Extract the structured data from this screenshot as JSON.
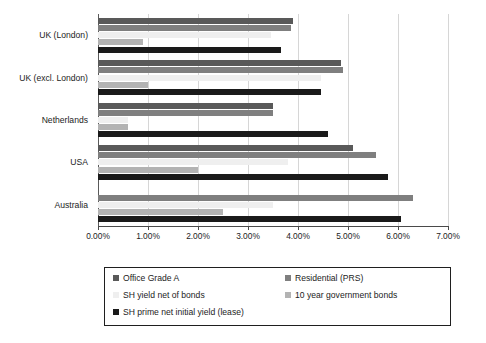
{
  "chart_data": {
    "type": "bar",
    "orientation": "horizontal",
    "title": "",
    "xlabel": "",
    "ylabel": "",
    "xlim": [
      0,
      7
    ],
    "xtick_labels": [
      "0.00%",
      "1.00%",
      "2.00%",
      "3.00%",
      "4.00%",
      "5.00%",
      "6.00%",
      "7.00%"
    ],
    "xticks": [
      0,
      1,
      2,
      3,
      4,
      5,
      6,
      7
    ],
    "grid": true,
    "legend_position": "bottom",
    "categories": [
      "UK (London)",
      "UK (excl. London)",
      "Netherlands",
      "USA",
      "Australia"
    ],
    "series": [
      {
        "name": "Office Grade A",
        "color": "#595959",
        "values": [
          3.9,
          4.85,
          3.5,
          5.1,
          0.0
        ]
      },
      {
        "name": "Residential (PRS)",
        "color": "#7f7f7f",
        "values": [
          3.85,
          4.9,
          3.5,
          5.55,
          6.3
        ]
      },
      {
        "name": "SH yield net of bonds",
        "color": "#efefef",
        "values": [
          3.45,
          4.45,
          0.6,
          3.8,
          3.5
        ]
      },
      {
        "name": "10 year government bonds",
        "color": "#b3b3b3",
        "values": [
          0.9,
          1.0,
          0.6,
          2.0,
          2.5
        ]
      },
      {
        "name": "SH prime net initial yield (lease)",
        "color": "#1a1a1a",
        "values": [
          3.65,
          4.45,
          4.6,
          5.8,
          6.05
        ]
      }
    ]
  },
  "legend": {
    "items": [
      {
        "label": "Office Grade A",
        "color": "#595959"
      },
      {
        "label": "Residential (PRS)",
        "color": "#7f7f7f"
      },
      {
        "label": "SH yield net of bonds",
        "color": "#efefef"
      },
      {
        "label": "10 year government bonds",
        "color": "#b3b3b3"
      },
      {
        "label": "SH prime net initial yield (lease)",
        "color": "#1a1a1a"
      }
    ]
  },
  "caption": {
    "text": ""
  }
}
